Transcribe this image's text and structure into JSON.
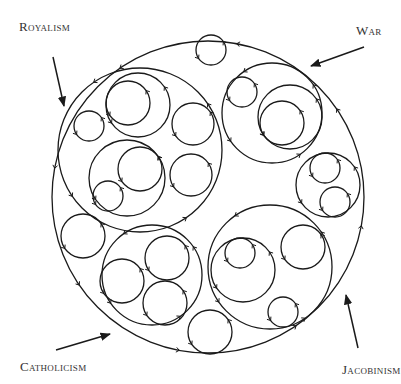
{
  "diagram": {
    "labels": {
      "royalism": "Royalism",
      "war": "War",
      "catholicism": "Catholicism",
      "jacobinism": "Jacobinism"
    },
    "stroke_color": "#1a1a1a",
    "text_color": "#333333",
    "outer_circle": {
      "cx": 208,
      "cy": 197,
      "r": 156
    },
    "circles": [
      {
        "id": "top-small",
        "cx": 211,
        "cy": 50,
        "r": 15
      },
      {
        "id": "royalism-container",
        "cx": 140,
        "cy": 150,
        "r": 82
      },
      {
        "id": "royalism-upper-loop",
        "cx": 138,
        "cy": 105,
        "r": 32
      },
      {
        "id": "royalism-upper-inner",
        "cx": 128,
        "cy": 103,
        "r": 22
      },
      {
        "id": "royalism-left-small",
        "cx": 89,
        "cy": 126,
        "r": 15
      },
      {
        "id": "royalism-right",
        "cx": 193,
        "cy": 124,
        "r": 21
      },
      {
        "id": "royalism-lower-loop",
        "cx": 127,
        "cy": 178,
        "r": 38
      },
      {
        "id": "royalism-lower-inner",
        "cx": 140,
        "cy": 169,
        "r": 22
      },
      {
        "id": "royalism-lower-small",
        "cx": 108,
        "cy": 196,
        "r": 15
      },
      {
        "id": "royalism-lower-right",
        "cx": 191,
        "cy": 175,
        "r": 21
      },
      {
        "id": "war-container",
        "cx": 272,
        "cy": 113,
        "r": 50
      },
      {
        "id": "war-small",
        "cx": 242,
        "cy": 92,
        "r": 15
      },
      {
        "id": "war-mid",
        "cx": 290,
        "cy": 117,
        "r": 32
      },
      {
        "id": "war-inner",
        "cx": 282,
        "cy": 123,
        "r": 22
      },
      {
        "id": "right-container",
        "cx": 328,
        "cy": 185,
        "r": 32
      },
      {
        "id": "right-upper",
        "cx": 325,
        "cy": 168,
        "r": 15
      },
      {
        "id": "right-lower",
        "cx": 335,
        "cy": 202,
        "r": 15
      },
      {
        "id": "jacobinism-container",
        "cx": 270,
        "cy": 267,
        "r": 62
      },
      {
        "id": "jacobinism-left",
        "cx": 243,
        "cy": 270,
        "r": 32
      },
      {
        "id": "jacobinism-inner",
        "cx": 240,
        "cy": 253,
        "r": 15
      },
      {
        "id": "jacobinism-right",
        "cx": 303,
        "cy": 247,
        "r": 22
      },
      {
        "id": "jacobinism-bottom",
        "cx": 283,
        "cy": 312,
        "r": 15
      },
      {
        "id": "catholicism-container",
        "cx": 152,
        "cy": 275,
        "r": 50
      },
      {
        "id": "catholicism-left",
        "cx": 122,
        "cy": 281,
        "r": 22
      },
      {
        "id": "catholicism-top-right",
        "cx": 167,
        "cy": 258,
        "r": 22
      },
      {
        "id": "catholicism-bottom-right",
        "cx": 165,
        "cy": 303,
        "r": 22
      },
      {
        "id": "far-left",
        "cx": 83,
        "cy": 236,
        "r": 22
      },
      {
        "id": "bottom",
        "cx": 210,
        "cy": 332,
        "r": 22
      }
    ],
    "arrows": [
      {
        "id": "royalism-arrow",
        "x1": 53,
        "y1": 57,
        "x2": 64,
        "y2": 106
      },
      {
        "id": "war-arrow",
        "x1": 364,
        "y1": 47,
        "x2": 311,
        "y2": 66
      },
      {
        "id": "catholicism-arrow",
        "x1": 56,
        "y1": 350,
        "x2": 110,
        "y2": 334
      },
      {
        "id": "jacobinism-arrow",
        "x1": 358,
        "y1": 348,
        "x2": 346,
        "y2": 295
      }
    ]
  }
}
